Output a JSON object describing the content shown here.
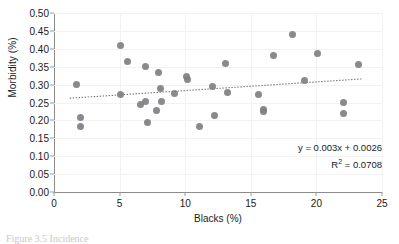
{
  "figure": {
    "caption_fragment": "Figure 3.5  Incidence"
  },
  "chart_data": {
    "type": "scatter",
    "title": "",
    "xlabel": "Blacks (%)",
    "ylabel": "Morbidity (%)",
    "xlim": [
      0,
      25
    ],
    "ylim": [
      0,
      0.5
    ],
    "xticks": [
      "0",
      "5",
      "10",
      "15",
      "20",
      "25"
    ],
    "xtick_values": [
      0,
      5,
      10,
      15,
      20,
      25
    ],
    "yticks": [
      "0.00",
      "0.05",
      "0.10",
      "0.15",
      "0.20",
      "0.25",
      "0.30",
      "0.35",
      "0.40",
      "0.45",
      "0.50"
    ],
    "ytick_values": [
      0,
      0.05,
      0.1,
      0.15,
      0.2,
      0.25,
      0.3,
      0.35,
      0.4,
      0.45,
      0.5
    ],
    "grid": true,
    "legend": false,
    "marker_color": "#7f8083",
    "trendline_color": "#6f7174",
    "trendline_style": "dotted",
    "annotations": {
      "equation": "y = 0.003x + 0.0026",
      "r_squared_label": "R",
      "r_squared_exponent": "2",
      "r_squared_value": "= 0.0708",
      "r_squared_full": "R2 = 0.0708"
    },
    "trendline": {
      "slope": 0.003,
      "intercept": 0.0026,
      "r_squared": 0.0708,
      "x_start": 1.2,
      "x_end": 23.5,
      "y_start": 0.262,
      "y_end": 0.316
    },
    "points": [
      {
        "x": 1.7,
        "y": 0.301
      },
      {
        "x": 2.0,
        "y": 0.207
      },
      {
        "x": 2.0,
        "y": 0.184
      },
      {
        "x": 5.1,
        "y": 0.41
      },
      {
        "x": 5.1,
        "y": 0.272
      },
      {
        "x": 5.6,
        "y": 0.365
      },
      {
        "x": 6.6,
        "y": 0.245
      },
      {
        "x": 7.0,
        "y": 0.35
      },
      {
        "x": 7.0,
        "y": 0.254
      },
      {
        "x": 7.1,
        "y": 0.193
      },
      {
        "x": 7.8,
        "y": 0.229
      },
      {
        "x": 8.0,
        "y": 0.334
      },
      {
        "x": 8.1,
        "y": 0.29
      },
      {
        "x": 8.2,
        "y": 0.254
      },
      {
        "x": 9.2,
        "y": 0.275
      },
      {
        "x": 10.1,
        "y": 0.322
      },
      {
        "x": 10.2,
        "y": 0.313
      },
      {
        "x": 11.1,
        "y": 0.184
      },
      {
        "x": 12.1,
        "y": 0.295
      },
      {
        "x": 12.2,
        "y": 0.213
      },
      {
        "x": 13.1,
        "y": 0.36
      },
      {
        "x": 13.2,
        "y": 0.277
      },
      {
        "x": 15.6,
        "y": 0.271
      },
      {
        "x": 16.0,
        "y": 0.231
      },
      {
        "x": 16.0,
        "y": 0.224
      },
      {
        "x": 16.7,
        "y": 0.38
      },
      {
        "x": 18.2,
        "y": 0.439
      },
      {
        "x": 19.1,
        "y": 0.312
      },
      {
        "x": 20.1,
        "y": 0.386
      },
      {
        "x": 22.1,
        "y": 0.251
      },
      {
        "x": 22.1,
        "y": 0.22
      },
      {
        "x": 23.2,
        "y": 0.356
      }
    ]
  }
}
